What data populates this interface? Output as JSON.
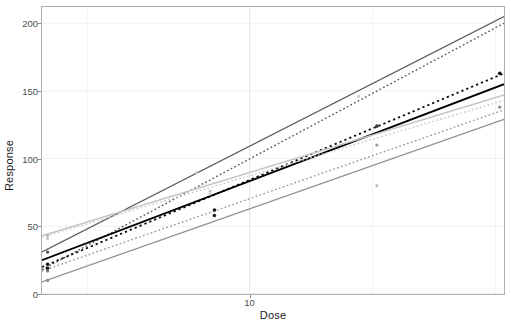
{
  "chart_data": {
    "type": "line",
    "title": "",
    "subtitle": "",
    "xlabel": "Dose",
    "ylabel": "Response",
    "xscale": "log",
    "yscale": "linear",
    "xlim": [
      3.1,
      42.0
    ],
    "ylim": [
      0,
      212
    ],
    "x_ticks": [
      10
    ],
    "x_tick_labels": [
      "10"
    ],
    "y_ticks": [
      0,
      50,
      100,
      150,
      200
    ],
    "y_tick_labels": [
      "0",
      "50",
      "100",
      "150",
      "200"
    ],
    "grid": true,
    "grid_color": "#ececed",
    "panel_border_color": "#b0b0b0",
    "legend": "none",
    "series": [
      {
        "name": "fit-1-solid-dark-upper",
        "style": "solid",
        "color": "#5a5a5a",
        "width": 1.2,
        "x": [
          3.1,
          42.0
        ],
        "y": [
          31,
          205
        ]
      },
      {
        "name": "fit-2-dashed-dark-upper",
        "style": "dashed",
        "color": "#5a5a5a",
        "width": 1.4,
        "x": [
          3.1,
          42.0
        ],
        "y": [
          18,
          200
        ]
      },
      {
        "name": "fit-3-dashed-black-middle",
        "style": "dashed",
        "color": "#0d0d0d",
        "width": 1.8,
        "x": [
          3.1,
          42.0
        ],
        "y": [
          20,
          163
        ]
      },
      {
        "name": "fit-4-solid-black-middle",
        "style": "solid",
        "color": "#000000",
        "width": 1.8,
        "x": [
          3.1,
          42.0
        ],
        "y": [
          25,
          155
        ]
      },
      {
        "name": "fit-5-solid-light-upperlow",
        "style": "solid",
        "color": "#c4c4c4",
        "width": 1.3,
        "x": [
          3.1,
          42.0
        ],
        "y": [
          43,
          147
        ]
      },
      {
        "name": "fit-6-dashed-light",
        "style": "dashed",
        "color": "#c9c9c9",
        "width": 1.4,
        "x": [
          3.1,
          42.0
        ],
        "y": [
          42,
          143
        ]
      },
      {
        "name": "fit-7-dashed-mid-lower",
        "style": "dashed",
        "color": "#9a9a9a",
        "width": 1.4,
        "x": [
          3.1,
          42.0
        ],
        "y": [
          17,
          136
        ]
      },
      {
        "name": "fit-8-solid-mid-lower",
        "style": "solid",
        "color": "#8e8e8e",
        "width": 1.3,
        "x": [
          3.1,
          42.0
        ],
        "y": [
          9,
          129
        ]
      }
    ],
    "points": [
      {
        "name": "obs-1",
        "x": 3.2,
        "y": 43,
        "color": "#b9b9b9",
        "size": 1.6
      },
      {
        "name": "obs-2",
        "x": 3.2,
        "y": 41,
        "color": "#c4c4c4",
        "size": 1.6
      },
      {
        "name": "obs-3",
        "x": 3.2,
        "y": 31,
        "color": "#4d4d4d",
        "size": 1.6
      },
      {
        "name": "obs-4",
        "x": 3.2,
        "y": 22,
        "color": "#1a1a1a",
        "size": 1.8
      },
      {
        "name": "obs-5",
        "x": 3.2,
        "y": 19,
        "color": "#111111",
        "size": 1.8
      },
      {
        "name": "obs-6",
        "x": 3.2,
        "y": 17,
        "color": "#7a7a7a",
        "size": 1.6
      },
      {
        "name": "obs-7",
        "x": 3.2,
        "y": 10,
        "color": "#8e8e8e",
        "size": 1.6
      },
      {
        "name": "obs-8",
        "x": 8.0,
        "y": 76,
        "color": "#c4c4c4",
        "size": 1.6
      },
      {
        "name": "obs-9",
        "x": 8.0,
        "y": 74,
        "color": "#cfcfcf",
        "size": 1.6
      },
      {
        "name": "obs-10",
        "x": 8.2,
        "y": 62,
        "color": "#1a1a1a",
        "size": 1.8
      },
      {
        "name": "obs-11",
        "x": 8.2,
        "y": 58,
        "color": "#222222",
        "size": 1.8
      },
      {
        "name": "obs-12",
        "x": 7.4,
        "y": 90,
        "color": "#d5d5d5",
        "size": 1.5
      },
      {
        "name": "obs-13",
        "x": 18.5,
        "y": 146,
        "color": "#c9c9c9",
        "size": 1.5
      },
      {
        "name": "obs-14",
        "x": 20.5,
        "y": 124,
        "color": "#3a3a3a",
        "size": 1.8
      },
      {
        "name": "obs-15",
        "x": 20.5,
        "y": 110,
        "color": "#9a9a9a",
        "size": 1.6
      },
      {
        "name": "obs-16",
        "x": 20.5,
        "y": 80,
        "color": "#b9b9b9",
        "size": 1.5
      },
      {
        "name": "obs-17",
        "x": 41.0,
        "y": 163,
        "color": "#111111",
        "size": 1.8
      },
      {
        "name": "obs-18",
        "x": 41.0,
        "y": 138,
        "color": "#8e8e8e",
        "size": 1.6
      }
    ]
  },
  "axes": {
    "y_title": "Response",
    "x_title": "Dose"
  }
}
